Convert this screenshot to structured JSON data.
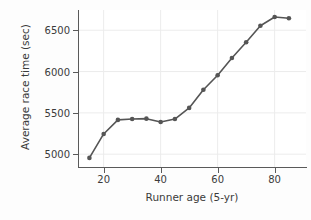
{
  "chart_data": {
    "type": "line",
    "title": "",
    "xlabel": "Runner age (5-yr)",
    "ylabel": "Average race time (sec)",
    "x": [
      15,
      20,
      25,
      30,
      35,
      40,
      45,
      50,
      55,
      60,
      65,
      70,
      75,
      80,
      85
    ],
    "values": [
      4955,
      5245,
      5415,
      5425,
      5430,
      5390,
      5425,
      5560,
      5780,
      5955,
      6165,
      6355,
      6555,
      6660,
      6645
    ],
    "series": [
      {
        "name": "Average race time",
        "values": [
          4955,
          5245,
          5415,
          5425,
          5430,
          5390,
          5425,
          5560,
          5780,
          5955,
          6165,
          6355,
          6555,
          6660,
          6645
        ]
      }
    ],
    "xlim": [
      11,
      91
    ],
    "ylim": [
      4845,
      6745
    ],
    "xticks": [
      20,
      40,
      60,
      80
    ],
    "xtick_labels": [
      "20",
      "40",
      "60",
      "80"
    ],
    "yticks": [
      5000,
      5500,
      6000,
      6500
    ],
    "ytick_labels": [
      "5000",
      "5500",
      "6000",
      "6500"
    ],
    "grid": true,
    "legend": "none",
    "marker": "circle",
    "line_color": "#555555",
    "marker_color": "#555555",
    "grid_color": "#ececec",
    "axis_color": "#5a5a5a",
    "plot_background": "#ffffff",
    "figure_background": "#fdfdfd"
  }
}
